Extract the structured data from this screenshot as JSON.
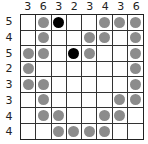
{
  "puzzle": {
    "col_clues": [
      "3",
      "6",
      "3",
      "2",
      "3",
      "4",
      "3",
      "6"
    ],
    "row_clues": [
      "5",
      "4",
      "5",
      "2",
      "3",
      "3",
      "4",
      "4"
    ],
    "colors": {
      "gray": "#8c8c8c",
      "black": "#000000",
      "grid": "#333333"
    },
    "cells": [
      [
        ".",
        "g",
        "b",
        ".",
        ".",
        "g",
        "g",
        "g"
      ],
      [
        ".",
        "g",
        ".",
        ".",
        "g",
        "g",
        ".",
        "g"
      ],
      [
        "g",
        "g",
        ".",
        "b",
        "g",
        ".",
        ".",
        "g"
      ],
      [
        "g",
        ".",
        ".",
        ".",
        ".",
        ".",
        ".",
        "g"
      ],
      [
        "g",
        "g",
        ".",
        ".",
        ".",
        ".",
        ".",
        "g"
      ],
      [
        ".",
        "g",
        ".",
        ".",
        ".",
        ".",
        "g",
        "g"
      ],
      [
        ".",
        "g",
        "g",
        ".",
        ".",
        "g",
        "g",
        "."
      ],
      [
        ".",
        ".",
        "g",
        "g",
        "g",
        "g",
        ".",
        "."
      ]
    ]
  }
}
